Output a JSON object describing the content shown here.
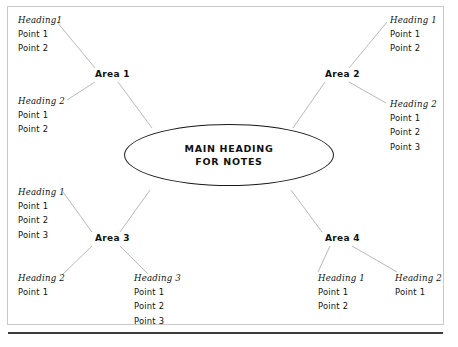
{
  "figure": {
    "type": "mind-map",
    "center": {
      "line1": "MAIN HEADING",
      "line2": "FOR NOTES"
    },
    "areas": [
      {
        "id": "area-1",
        "label": "Area 1"
      },
      {
        "id": "area-2",
        "label": "Area 2"
      },
      {
        "id": "area-3",
        "label": "Area 3"
      },
      {
        "id": "area-4",
        "label": "Area 4"
      }
    ],
    "branches": [
      {
        "id": "area-1-branch-1",
        "area": "Area 1",
        "heading": "Heading1",
        "points": [
          "Point 1",
          "Point 2"
        ]
      },
      {
        "id": "area-1-branch-2",
        "area": "Area 1",
        "heading": "Heading 2",
        "points": [
          "Point 1",
          "Point 2"
        ]
      },
      {
        "id": "area-2-branch-1",
        "area": "Area 2",
        "heading": "Heading 1",
        "points": [
          "Point 1",
          "Point 2"
        ]
      },
      {
        "id": "area-2-branch-2",
        "area": "Area 2",
        "heading": "Heading 2",
        "points": [
          "Point 1",
          "Point 2",
          "Point 3"
        ]
      },
      {
        "id": "area-3-branch-1",
        "area": "Area 3",
        "heading": "Heading 1",
        "points": [
          "Point 1",
          "Point 2",
          "Point 3"
        ]
      },
      {
        "id": "area-3-branch-2",
        "area": "Area 3",
        "heading": "Heading 2",
        "points": [
          "Point 1"
        ]
      },
      {
        "id": "area-3-branch-3",
        "area": "Area 3",
        "heading": "Heading 3",
        "points": [
          "Point 1",
          "Point 2",
          "Point 3"
        ]
      },
      {
        "id": "area-4-branch-1",
        "area": "Area 4",
        "heading": "Heading 1",
        "points": [
          "Point 1",
          "Point 2"
        ]
      },
      {
        "id": "area-4-branch-2",
        "area": "Area 4",
        "heading": "Heading 2",
        "points": [
          "Point 1"
        ]
      }
    ],
    "colors": {
      "text": "#111111",
      "ellipse_stroke": "#1a1a1a",
      "connector": "#b9b9b9",
      "frame": "#c9c9c9",
      "rule": "#3d3d3d",
      "background": "#ffffff"
    }
  }
}
